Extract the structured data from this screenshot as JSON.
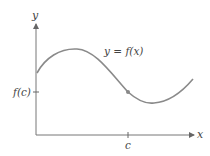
{
  "diagram": {
    "curve_label": "y = f(x)",
    "y_axis_label": "y",
    "x_axis_label": "x",
    "y_tick_label": "f(c)",
    "x_tick_label": "c",
    "colors": {
      "axis": "#777777",
      "curve": "#8a8a8a",
      "point": "#888888",
      "text": "#444444"
    }
  }
}
